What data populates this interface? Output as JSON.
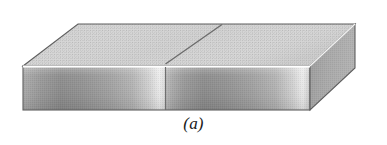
{
  "figure": {
    "caption": "(a)",
    "background_color": "#ffffff",
    "colors": {
      "top_face": "#cfcfcf",
      "top_face_light": "#d9d9d9",
      "front_face_dark": "#8f8f8f",
      "front_face_mid": "#ababab",
      "front_face_highlight": "#e8e8e8",
      "right_face": "#a8a8a8",
      "right_face_dark": "#9a9a9a",
      "outline": "#5a5a5a",
      "seam_line": "#6a6a6a",
      "edge_highlight": "#ffffff",
      "caption_text": "#1a1a1a"
    },
    "geometry": {
      "top_face_points": "78,24 355,24 310,66 23,66",
      "front_face_points": "23,66 310,66 310,110 23,110",
      "right_face_points": "310,66 355,24 355,68 310,110",
      "seam_top_points": "222,24 165,62",
      "seam_front_points": "165,66 165,110",
      "edge_highlight_points": "23,66 310,66",
      "right_edge_highlight_points": "310,66 355,24"
    },
    "labels": {
      "top_face": "top-face",
      "front_face": "front-face",
      "right_face": "right-face",
      "seam": "seam-divider"
    }
  }
}
